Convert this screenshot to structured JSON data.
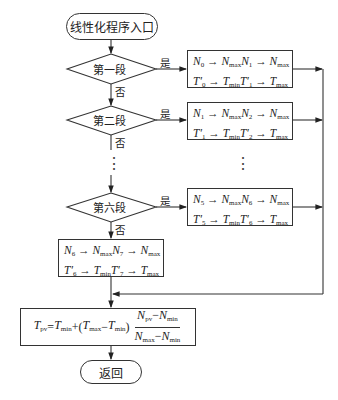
{
  "diagram": {
    "start": {
      "label": "线性化程序入口"
    },
    "end": {
      "label": "返回"
    },
    "yes_label": "是",
    "no_label": "否",
    "decisions": [
      {
        "label": "第一段"
      },
      {
        "label": "第二段"
      },
      {
        "label": "第六段"
      }
    ],
    "process_boxes": [
      {
        "line1": "N0 → Nmax N1 → Nmax",
        "line2": "T′0 → Tmin T′1 → Tmax",
        "n_a": "0",
        "n_b": "1"
      },
      {
        "line1": "N1 → Nmax N2 → Nmax",
        "line2": "T′1 → Tmin T′2 → Tmax",
        "n_a": "1",
        "n_b": "2"
      },
      {
        "line1": "N5 → Nmax N6 → Nmax",
        "line2": "T′5 → Tmin T′6 → Tmax",
        "n_a": "5",
        "n_b": "6"
      }
    ],
    "default_box": {
      "line1": "N6 → Nmax N7 → Nmax",
      "line2": "T′6 → Tmin T′7 → Tmax",
      "n_a": "6",
      "n_b": "7"
    },
    "formula": {
      "text": "Tpv = Tmin + (Tmax − Tmin) (Npv − Nmin)/(Nmax − Nmin)",
      "lhs": "T",
      "lhs_sub": "pv",
      "eq": "=",
      "t1": "T",
      "t1_sub": "min",
      "plus": "+(",
      "t2": "T",
      "t2_sub": "max",
      "minus": "−",
      "t3": "T",
      "t3_sub": "min",
      "close": ")",
      "num_a": "N",
      "num_a_sub": "pv",
      "num_b": "N",
      "num_b_sub": "min",
      "den_a": "N",
      "den_a_sub": "max",
      "den_b": "N",
      "den_b_sub": "min"
    },
    "ellipsis": "⋮",
    "sym": {
      "arrow": " → ",
      "N": "N",
      "T": "T",
      "max": "max",
      "min": "min",
      "prime": "′"
    }
  }
}
